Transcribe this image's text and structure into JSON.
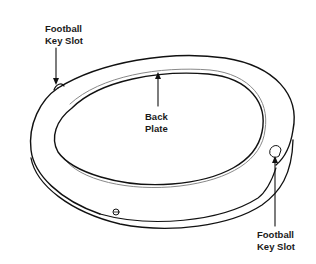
{
  "diagram": {
    "type": "technical-illustration",
    "labels": [
      {
        "id": "key-slot-top",
        "line1": "Football",
        "line2": "Key Slot"
      },
      {
        "id": "back-plate",
        "line1": "Back",
        "line2": "Plate"
      },
      {
        "id": "key-slot-bottom",
        "line1": "Football",
        "line2": "Key Slot"
      }
    ]
  }
}
